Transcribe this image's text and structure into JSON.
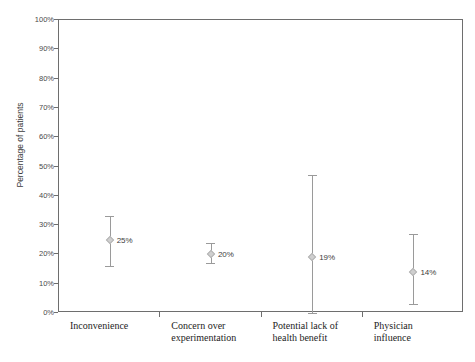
{
  "chart_data": {
    "type": "scatter",
    "title": "",
    "xlabel": "",
    "ylabel": "Percentage of patients",
    "ylim": [
      0,
      100
    ],
    "grid": false,
    "legend": false,
    "categories": [
      "Inconvenience",
      "Concern over experimentation",
      "Potential lack of health benefit",
      "Physician influence"
    ],
    "category_lines": [
      [
        "Inconvenience"
      ],
      [
        "Concern over",
        "experimentation"
      ],
      [
        "Potential lack of",
        "health benefit"
      ],
      [
        "Physician",
        "influence"
      ]
    ],
    "values": [
      25,
      20,
      19,
      14
    ],
    "value_labels": [
      "25%",
      "20%",
      "19%",
      "14%"
    ],
    "error_low": [
      16,
      17,
      0,
      3
    ],
    "error_high": [
      33,
      24,
      47,
      27
    ],
    "ytick_labels": [
      "0%",
      "10%",
      "20%",
      "30%",
      "40%",
      "50%",
      "60%",
      "70%",
      "80%",
      "90%",
      "100%"
    ],
    "ytick_values": [
      0,
      10,
      20,
      30,
      40,
      50,
      60,
      70,
      80,
      90,
      100
    ]
  },
  "style": {
    "axis_color": "#6e6e6e",
    "marker_color": "#cfcfcf",
    "errorbar_color": "#9a9a9a",
    "text_color": "#1d1d1d",
    "background": "#ffffff"
  }
}
